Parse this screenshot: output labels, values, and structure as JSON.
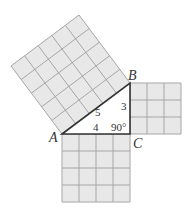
{
  "diagram": {
    "vertices": [
      {
        "label": "A",
        "x": 62,
        "y": 134
      },
      {
        "label": "B",
        "x": 130,
        "y": 83
      },
      {
        "label": "C",
        "x": 130,
        "y": 134
      }
    ],
    "sides": {
      "hypotenuse_AB": "5",
      "leg_BC": "3",
      "leg_AC": "4"
    },
    "right_angle_label": "90°",
    "squares": [
      {
        "name": "square-on-AB",
        "grid": 5
      },
      {
        "name": "square-on-BC",
        "grid": 3
      },
      {
        "name": "square-on-AC",
        "grid": 4
      }
    ],
    "colors": {
      "square_fill": "#e8e8e8",
      "grid_line": "#a6a6a6",
      "triangle_edge": "#333333",
      "background": "#ffffff"
    }
  }
}
